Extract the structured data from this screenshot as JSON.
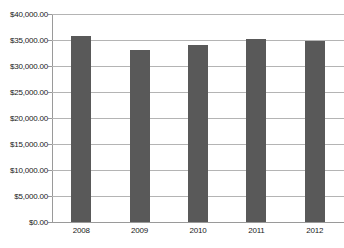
{
  "chart_data": {
    "type": "bar",
    "title": "",
    "subtitle": "",
    "xlabel": "",
    "ylabel": "",
    "categories": [
      "2008",
      "2009",
      "2010",
      "2011",
      "2012"
    ],
    "values": [
      35700,
      33000,
      34000,
      35200,
      34800
    ],
    "series": [
      {
        "name": "",
        "values": [
          35700,
          33000,
          34000,
          35200,
          34800
        ]
      }
    ],
    "ylim": [
      0,
      40000
    ],
    "ytick_values": [
      0,
      5000,
      10000,
      15000,
      20000,
      25000,
      30000,
      35000,
      40000
    ],
    "ytick_labels": [
      "$0.00",
      "$5,000.00",
      "$10,000.00",
      "$15,000.00",
      "$20,000.00",
      "$25,000.00",
      "$30,000.00",
      "$35,000.00",
      "$40,000.00"
    ],
    "grid": true,
    "grid_axis": "y",
    "legend": false,
    "legend_position": "none",
    "annotations": [],
    "colors": {
      "bar": "#595959",
      "gridline": "#b4b4b4",
      "axis": "#9a9a9a",
      "text": "#1a1a1a",
      "background": "#ffffff"
    }
  }
}
